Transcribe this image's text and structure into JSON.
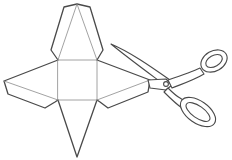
{
  "figure": {
    "description": "Line illustration of a square pyramid net with glue flaps being cut out by scissors",
    "subjects": [
      "pyramid-net",
      "scissors"
    ],
    "colors": {
      "background": "#ffffff",
      "outline": "#4a4a4a",
      "fold_line": "#8a8a8a",
      "scissors_fill": "#ffffff"
    }
  }
}
